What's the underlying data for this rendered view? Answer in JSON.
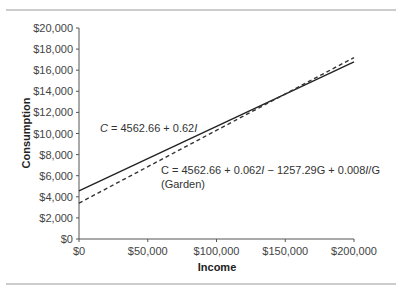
{
  "chart_data": {
    "type": "line",
    "title": "",
    "xlabel": "Income",
    "ylabel": "Consumption",
    "xlim": [
      0,
      200000
    ],
    "ylim": [
      0,
      20000
    ],
    "x_ticks": [
      0,
      50000,
      100000,
      150000,
      200000
    ],
    "x_tick_labels": [
      "$0",
      "$50,000",
      "$100,000",
      "$150,000",
      "$200,000"
    ],
    "y_ticks": [
      0,
      2000,
      4000,
      6000,
      8000,
      10000,
      12000,
      14000,
      16000,
      18000,
      20000
    ],
    "y_tick_labels": [
      "$0",
      "$2,000",
      "$4,000",
      "$6,000",
      "$8,000",
      "$10,000",
      "$12,000",
      "$14,000",
      "$16,000",
      "$18,000",
      "$20,000"
    ],
    "grid": false,
    "series": [
      {
        "name": "C = 4562.66 + 0.62I",
        "style": "solid",
        "color": "#222222",
        "x": [
          0,
          200000
        ],
        "y": [
          4562.66,
          16800
        ]
      },
      {
        "name": "C = 4562.66 + 0.062I − 1257.29G + 0.008IG (Garden)",
        "style": "dashed",
        "color": "#333333",
        "x": [
          0,
          200000
        ],
        "y": [
          3400,
          17200
        ]
      }
    ],
    "annotations": [
      {
        "id": "solid",
        "parts": [
          "C",
          " = 4562.66 + 0.62",
          "I"
        ]
      },
      {
        "id": "dashed",
        "line1": [
          "C = 4562.66 + 0.062",
          "I",
          " − 1257.29G + 0.008",
          "I",
          "/G"
        ],
        "line2": "(Garden)"
      }
    ]
  }
}
